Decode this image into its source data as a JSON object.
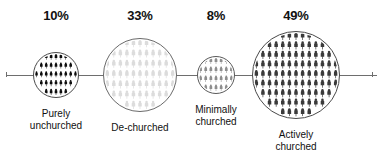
{
  "chart_data": {
    "type": "bar",
    "title": "",
    "subtitle": "",
    "xlabel": "",
    "ylabel": "",
    "grid": false,
    "legend": "none",
    "units": "percent",
    "categories": [
      "Purely unchurched",
      "De-churched",
      "Minimally churched",
      "Actively churched"
    ],
    "values": [
      10,
      33,
      8,
      49
    ],
    "value_labels": [
      "10%",
      "33%",
      "8%",
      "49%"
    ],
    "encoding": "proportional-area-circles-with-people-pictograms-on-horizontal-axis",
    "series": [
      {
        "name": "Share of population",
        "values": [
          10,
          33,
          8,
          49
        ]
      }
    ]
  },
  "axis": {
    "line_color": "#6e6e6e",
    "orientation": "horizontal"
  },
  "groups": [
    {
      "id": "purely-unchurched",
      "percent_label": "10%",
      "value": 10,
      "label": "Purely\nunchurched",
      "label_line1": "Purely",
      "label_line2": "unchurched",
      "figure_color": "#0d0d0d",
      "circle_stroke": "#4a4a4a",
      "diameter_px": 46,
      "center_x_px": 56,
      "rows": 5,
      "cols": 9
    },
    {
      "id": "de-churched",
      "percent_label": "33%",
      "value": 33,
      "label": "De-churched",
      "label_line1": "De-churched",
      "label_line2": "",
      "figure_color": "#dcdcdc",
      "circle_stroke": "#6a6a6a",
      "diameter_px": 74,
      "center_x_px": 140,
      "rows": 7,
      "cols": 11
    },
    {
      "id": "minimally-churched",
      "percent_label": "8%",
      "value": 8,
      "label": "Minimally\nchurched",
      "label_line1": "Minimally",
      "label_line2": "churched",
      "figure_color": "#8e8e8e",
      "circle_stroke": "#5a5a5a",
      "diameter_px": 38,
      "center_x_px": 216,
      "rows": 4,
      "cols": 7
    },
    {
      "id": "actively-churched",
      "percent_label": "49%",
      "value": 49,
      "label": "Actively\nchurched",
      "label_line1": "Actively",
      "label_line2": "churched",
      "figure_color": "#3a3a3a",
      "circle_stroke": "#4a4a4a",
      "diameter_px": 88,
      "center_x_px": 296,
      "rows": 9,
      "cols": 13
    }
  ],
  "colors": {
    "background": "#ffffff",
    "text": "#111111",
    "axis": "#6e6e6e"
  }
}
